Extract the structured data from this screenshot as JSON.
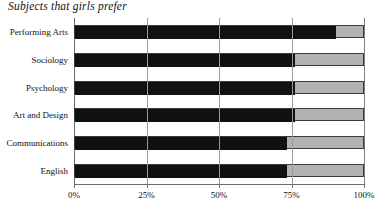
{
  "chart_data": {
    "type": "bar",
    "orientation": "horizontal",
    "stacked": true,
    "title": "Subjects that girls prefer",
    "xlabel": "",
    "ylabel": "",
    "xlim": [
      0,
      100
    ],
    "grid": true,
    "legend": "none",
    "categories": [
      "Performing Arts",
      "Sociology",
      "Psychology",
      "Art and Design",
      "Communications",
      "English"
    ],
    "series": [
      {
        "name": "Girls",
        "color": "#111111",
        "values": [
          90,
          76,
          76,
          76,
          73,
          73
        ]
      },
      {
        "name": "Remainder",
        "color": "#b2b2b2",
        "values": [
          10,
          24,
          24,
          24,
          27,
          27
        ]
      }
    ],
    "xticks": [
      {
        "value": 0,
        "label": "0%"
      },
      {
        "value": 25,
        "label": "25%"
      },
      {
        "value": 50,
        "label": "50%"
      },
      {
        "value": 75,
        "label": "75%"
      },
      {
        "value": 100,
        "label": "100%"
      }
    ]
  },
  "colors": {
    "bar_primary": "#111111",
    "bar_secondary": "#b2b2b2",
    "axis": "#6b6b6b",
    "gridline": "#9a9a9a",
    "text": "#111111",
    "background": "#ffffff"
  }
}
